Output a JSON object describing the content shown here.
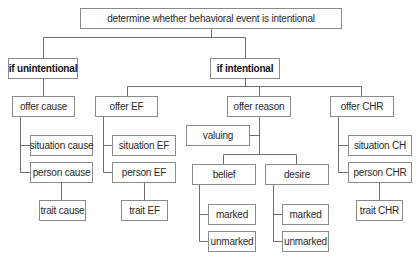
{
  "diagram": {
    "root": "determine whether behavioral event is intentional",
    "unintentional": {
      "label": "if unintentional",
      "offer": "offer cause",
      "children": [
        "situation cause",
        "person cause"
      ],
      "trait": "trait cause"
    },
    "intentional": {
      "label": "if intentional",
      "ef": {
        "offer": "offer EF",
        "children": [
          "situation EF",
          "person EF"
        ],
        "trait": "trait EF"
      },
      "reason": {
        "offer": "offer reason",
        "valuing": "valuing",
        "belief": {
          "label": "belief",
          "children": [
            "marked",
            "unmarked"
          ]
        },
        "desire": {
          "label": "desire",
          "children": [
            "marked",
            "unmarked"
          ]
        }
      },
      "chr": {
        "offer": "offer CHR",
        "children": [
          "situation CH",
          "person CHR"
        ],
        "trait": "trait CHR"
      }
    }
  }
}
